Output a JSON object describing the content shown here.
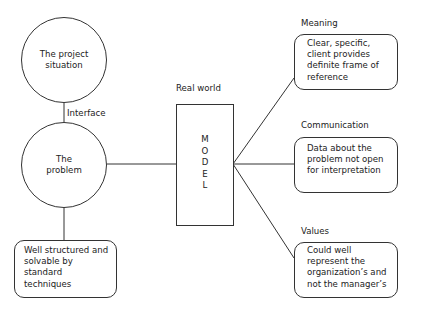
{
  "diagram": {
    "left_column": {
      "top_circle": {
        "text": "The project situation"
      },
      "interface_label": "Interface",
      "middle_circle": {
        "text": "The problem"
      },
      "bottom_box": {
        "text": "Well structured and solvable by standard techniques"
      }
    },
    "center": {
      "real_world_label": "Real world",
      "model_letters": [
        "M",
        "O",
        "D",
        "E",
        "L"
      ]
    },
    "right_column": [
      {
        "heading": "Meaning",
        "text": "Clear, specific, client provides definite frame of reference"
      },
      {
        "heading": "Communication",
        "text": "Data about the problem not open for interpretation"
      },
      {
        "heading": "Values",
        "text": "Could well represent the organization’s and not the manager’s"
      }
    ],
    "colors": {
      "stroke": "#333333",
      "text": "#222222",
      "background": "#ffffff"
    }
  }
}
